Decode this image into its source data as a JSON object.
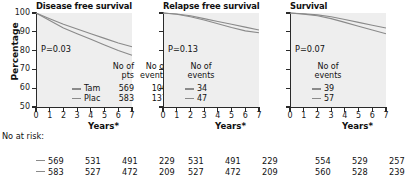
{
  "figure": {
    "yaxis_title": "Percentage",
    "xaxis_title": "Years*",
    "risk_label": "No at risk:",
    "colors": {
      "plot_background": "#eeeeee",
      "axis": "#2a2a2a",
      "curve": "#8a8a8a",
      "text": "#111111"
    }
  },
  "axes": {
    "y_ticks": [
      "100",
      "90",
      "80",
      "70",
      "60",
      "50"
    ],
    "y_values": [
      100,
      90,
      80,
      70,
      60,
      50
    ],
    "ylim": [
      50,
      100
    ],
    "x_ticks": [
      "0",
      "1",
      "2",
      "3",
      "4",
      "5",
      "6",
      "7"
    ],
    "x_values": [
      0,
      1,
      2,
      3,
      4,
      5,
      6,
      7
    ],
    "xlim": [
      0,
      7
    ]
  },
  "panels": [
    {
      "title": "Disease free survival",
      "pvalue": "P=0.03",
      "legend_header": [
        "No of",
        "No of",
        "pts",
        "events"
      ],
      "legend_header_line1_col1": "No of",
      "legend_header_line1_col2": "No of",
      "legend_header_line2_col1": "pts",
      "legend_header_line2_col2": "events",
      "rows": [
        {
          "name": "Tam",
          "pts": "569",
          "events": "106"
        },
        {
          "name": "Plac",
          "pts": "583",
          "events": "137"
        }
      ],
      "risk": [
        [
          "569",
          "531",
          "491",
          "229"
        ],
        [
          "583",
          "527",
          "472",
          "209"
        ]
      ]
    },
    {
      "title": "Relapse free survival",
      "pvalue": "P=0.13",
      "legend_header_line1_col2": "No of",
      "legend_header_line2_col2": "events",
      "rows": [
        {
          "name": "",
          "pts": "",
          "events": "34"
        },
        {
          "name": "",
          "pts": "",
          "events": "47"
        }
      ],
      "risk": [
        [
          "531",
          "491",
          "229"
        ],
        [
          "527",
          "472",
          "209"
        ]
      ]
    },
    {
      "title": "Survival",
      "pvalue": "P=0.07",
      "legend_header_line1_col2": "No of",
      "legend_header_line2_col2": "events",
      "rows": [
        {
          "name": "",
          "pts": "",
          "events": "39"
        },
        {
          "name": "",
          "pts": "",
          "events": "57"
        }
      ],
      "risk": [
        [
          "554",
          "529",
          "257"
        ],
        [
          "560",
          "528",
          "239"
        ]
      ]
    }
  ],
  "chart_data": {
    "type": "line",
    "xlabel": "Years*",
    "ylabel": "Percentage",
    "xlim": [
      0,
      7
    ],
    "ylim": [
      50,
      100
    ],
    "grid": false,
    "legend_position": "inside-lower-right",
    "panels": [
      {
        "title": "Disease free survival",
        "annotation": "P=0.03",
        "series": [
          {
            "name": "Tam",
            "no_of_pts": 569,
            "no_of_events": 106,
            "x": [
              0,
              1,
              2,
              3,
              4,
              5,
              6,
              7
            ],
            "y": [
              100,
              97,
              94,
              91.5,
              89,
              86.5,
              84,
              82
            ]
          },
          {
            "name": "Plac",
            "no_of_pts": 583,
            "no_of_events": 137,
            "x": [
              0,
              1,
              2,
              3,
              4,
              5,
              6,
              7
            ],
            "y": [
              100,
              96,
              92,
              89,
              86,
              83,
              80,
              77.5
            ]
          }
        ],
        "no_at_risk": {
          "x": [
            0,
            2,
            4,
            6
          ],
          "Tam": [
            569,
            531,
            491,
            229
          ],
          "Plac": [
            583,
            527,
            472,
            209
          ]
        }
      },
      {
        "title": "Relapse free survival",
        "annotation": "P=0.13",
        "series": [
          {
            "name": "Tam",
            "no_of_events": 34,
            "x": [
              0,
              1,
              2,
              3,
              4,
              5,
              6,
              7
            ],
            "y": [
              100,
              99.5,
              98.5,
              97,
              95.5,
              94,
              92.5,
              91
            ]
          },
          {
            "name": "Plac",
            "no_of_events": 47,
            "x": [
              0,
              1,
              2,
              3,
              4,
              5,
              6,
              7
            ],
            "y": [
              100,
              99.3,
              98,
              96.3,
              94.3,
              92.3,
              90.5,
              89.5
            ]
          }
        ],
        "no_at_risk": {
          "x": [
            2,
            4,
            6
          ],
          "Tam": [
            531,
            491,
            229
          ],
          "Plac": [
            527,
            472,
            209
          ]
        }
      },
      {
        "title": "Survival",
        "annotation": "P=0.07",
        "series": [
          {
            "name": "Tam",
            "no_of_events": 39,
            "x": [
              0,
              1,
              2,
              3,
              4,
              5,
              6,
              7
            ],
            "y": [
              100,
              99.6,
              99,
              98,
              96.5,
              95,
              93.5,
              92
            ]
          },
          {
            "name": "Plac",
            "no_of_events": 57,
            "x": [
              0,
              1,
              2,
              3,
              4,
              5,
              6,
              7
            ],
            "y": [
              100,
              99.4,
              98.5,
              97,
              95,
              93,
              91,
              89
            ]
          }
        ],
        "no_at_risk": {
          "x": [
            2,
            4,
            6
          ],
          "Tam": [
            554,
            529,
            257
          ],
          "Plac": [
            560,
            528,
            239
          ]
        }
      }
    ]
  }
}
